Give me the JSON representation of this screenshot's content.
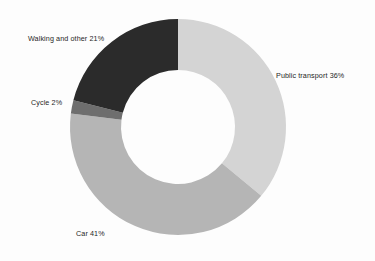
{
  "chart_data": {
    "type": "pie",
    "variant": "donut",
    "title": "",
    "subtitle": "",
    "xlabel": "",
    "ylabel": "",
    "legend_position": "none",
    "grid": false,
    "value_unit": "%",
    "total": 100,
    "start_angle_deg": 0,
    "direction": "clockwise",
    "center": {
      "x": 178,
      "y": 127
    },
    "outer_radius": 108,
    "inner_radius": 57,
    "background_color": "#fdfdfd",
    "label_color": "#262626",
    "categories": [
      "Public transport",
      "Car",
      "Cycle",
      "Walking and other"
    ],
    "values": [
      36,
      41,
      2,
      21
    ],
    "colors": [
      "#d4d4d4",
      "#b5b5b5",
      "#6e6e6e",
      "#2b2b2b"
    ],
    "slices": [
      {
        "name": "Public transport",
        "value": 36,
        "label": "Public transport 36%",
        "color": "#d4d4d4",
        "start_deg": 0,
        "end_deg": 129.6
      },
      {
        "name": "Car",
        "value": 41,
        "label": "Car 41%",
        "color": "#b5b5b5",
        "start_deg": 129.6,
        "end_deg": 277.2
      },
      {
        "name": "Cycle",
        "value": 2,
        "label": "Cycle 2%",
        "color": "#6e6e6e",
        "start_deg": 277.2,
        "end_deg": 284.4
      },
      {
        "name": "Walking and other",
        "value": 21,
        "label": "Walking and other 21%",
        "color": "#2b2b2b",
        "start_deg": 284.4,
        "end_deg": 360
      }
    ]
  }
}
